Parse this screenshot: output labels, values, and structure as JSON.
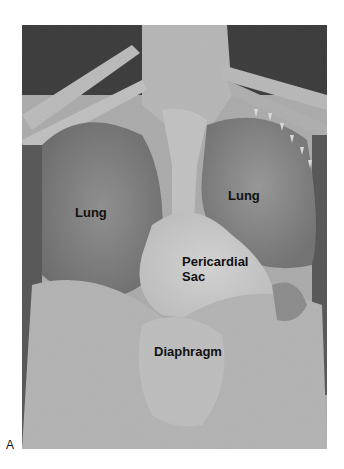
{
  "figure": {
    "panel_letter": "A",
    "labels": {
      "lung_right": "Lung",
      "lung_left": "Lung",
      "pericardial_sac": "Pericardial\nSac",
      "pericardial_sac_line1": "Pericardial",
      "pericardial_sac_line2": "Sac",
      "diaphragm": "Diaphragm"
    },
    "colors": {
      "background": "#ffffff",
      "label_text": "#111111",
      "arrow": "#ffffff"
    }
  }
}
